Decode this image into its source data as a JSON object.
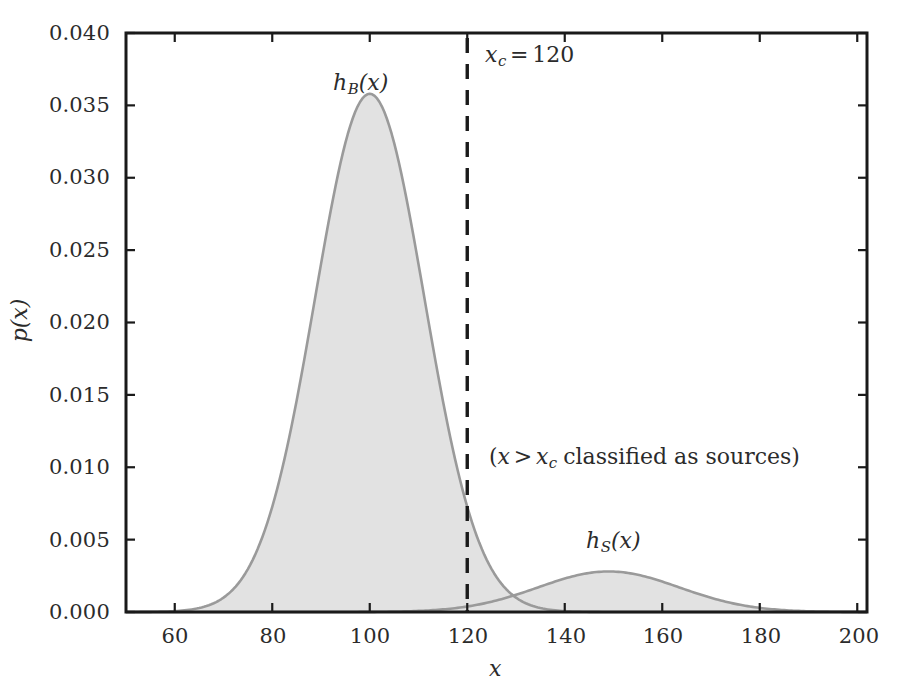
{
  "chart_data": {
    "type": "area",
    "title": "",
    "xlabel": "x",
    "ylabel": "p(x)",
    "xlim": [
      50,
      202
    ],
    "ylim": [
      0.0,
      0.04
    ],
    "grid": false,
    "legend_position": "inline-annotations",
    "xticks": [
      "60",
      "80",
      "100",
      "120",
      "140",
      "160",
      "180",
      "200"
    ],
    "xtick_values": [
      60,
      80,
      100,
      120,
      140,
      160,
      180,
      200
    ],
    "yticks": [
      "0.000",
      "0.005",
      "0.010",
      "0.015",
      "0.020",
      "0.025",
      "0.030",
      "0.035",
      "0.040"
    ],
    "ytick_values": [
      0.0,
      0.005,
      0.01,
      0.015,
      0.02,
      0.025,
      0.03,
      0.035,
      0.04
    ],
    "series": [
      {
        "name": "h_B(x)",
        "label": "h_B(x)",
        "kind": "gaussian_density_filled",
        "mean": 100,
        "sigma": 11.2,
        "peak": 0.0358,
        "fill_color": "#e2e2e2",
        "line_color": "#9a9a9a",
        "x": [
          50,
          55,
          60,
          65,
          70,
          75,
          80,
          85,
          90,
          95,
          100,
          105,
          110,
          115,
          120,
          125,
          130,
          135,
          140,
          145,
          150,
          155,
          160,
          165,
          170,
          175,
          180,
          185,
          190,
          195,
          200
        ],
        "values": [
          0.0,
          2e-05,
          0.00011,
          0.00049,
          0.00172,
          0.00484,
          0.0109,
          0.01965,
          0.02833,
          0.03266,
          0.0358,
          0.03266,
          0.02833,
          0.01965,
          0.0109,
          0.00484,
          0.00172,
          0.00049,
          0.00011,
          2e-05,
          0.0,
          0.0,
          0.0,
          0.0,
          0.0,
          0.0,
          0.0,
          0.0,
          0.0,
          0.0,
          0.0
        ]
      },
      {
        "name": "h_S(x)",
        "label": "h_S(x)",
        "kind": "gaussian_density_filled",
        "mean": 149,
        "sigma": 14.5,
        "peak": 0.0028,
        "fill_color": "#e2e2e2",
        "line_color": "#9a9a9a",
        "x": [
          100,
          105,
          110,
          115,
          120,
          125,
          130,
          135,
          140,
          145,
          150,
          155,
          160,
          165,
          170,
          175,
          180,
          185,
          190,
          195,
          200
        ],
        "values": [
          2e-05,
          5e-05,
          0.00013,
          0.0003,
          0.00062,
          0.00115,
          0.0019,
          0.00255,
          0.00275,
          0.0028,
          0.00277,
          0.00248,
          0.00192,
          0.0013,
          0.00079,
          0.00042,
          0.0002,
          9e-05,
          3e-05,
          1e-05,
          0.0
        ]
      }
    ],
    "annotations": [
      {
        "id": "cutoff-line",
        "type": "vline",
        "x": 120,
        "style": "dashed",
        "color": "#1a1a1a",
        "label": "x_c = 120"
      },
      {
        "id": "classification-note",
        "type": "text",
        "x": 133,
        "y": 0.0105,
        "label": "(x > x_c classified as sources)"
      }
    ]
  },
  "labels": {
    "hb_base": "h",
    "hb_sub": "B",
    "hb_arg": "(x)",
    "hs_base": "h",
    "hs_sub": "S",
    "hs_arg": "(x)",
    "xc_base": "x",
    "xc_sub": "c",
    "xc_eq": "=",
    "xc_value": "120",
    "note_open": "(",
    "note_x": "x",
    "note_gt": ">",
    "note_xc_base": "x",
    "note_xc_sub": "c",
    "note_rest": "classified as sources",
    "note_close": ")",
    "xaxis_title": "x",
    "yaxis_title": "p(x)"
  },
  "colors": {
    "axis": "#1a1a1a",
    "text": "#2b2b2b",
    "fill": "#e2e2e2",
    "curve_line": "#9a9a9a",
    "cutoff": "#1a1a1a",
    "background": "#ffffff"
  }
}
